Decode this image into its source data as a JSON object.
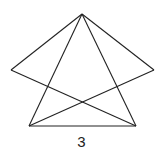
{
  "figure": {
    "label": "3",
    "stroke": "#222222",
    "points": {
      "top": [
        82,
        14
      ],
      "left": [
        11,
        70
      ],
      "right": [
        154,
        70
      ],
      "bottom_left": [
        29,
        126
      ],
      "bottom_right": [
        136,
        126
      ]
    },
    "segments": [
      [
        "top",
        "left"
      ],
      [
        "top",
        "right"
      ],
      [
        "top",
        "bottom_left"
      ],
      [
        "top",
        "bottom_right"
      ],
      [
        "left",
        "bottom_right"
      ],
      [
        "right",
        "bottom_left"
      ],
      [
        "bottom_left",
        "bottom_right"
      ]
    ]
  }
}
